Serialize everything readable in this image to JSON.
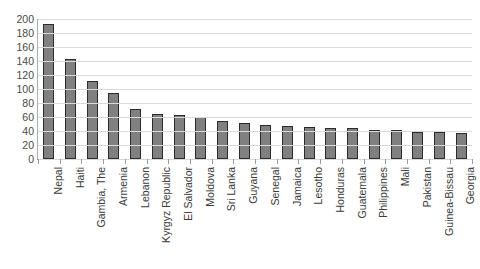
{
  "chart_data": {
    "type": "bar",
    "title": "",
    "xlabel": "",
    "ylabel": "",
    "ylim": [
      0,
      200
    ],
    "ytick_step": 20,
    "grid": true,
    "legend": false,
    "orientation": "vertical",
    "bar_color": "#808080",
    "bar_border_color": "#2b2b2b",
    "gridline_color": "#d9d9d9",
    "categories": [
      "Nepal",
      "Haiti",
      "Gambia, The",
      "Armenia",
      "Lebanon",
      "Kyrgyz Republic",
      "El Salvador",
      "Moldova",
      "Sri Lanka",
      "Guyana",
      "Senegal",
      "Jamaica",
      "Lesotho",
      "Honduras",
      "Guatemala",
      "Philippines",
      "Mali",
      "Pakistan",
      "Guinea-Bissau",
      "Georgia"
    ],
    "values": [
      193,
      143,
      111,
      94,
      71,
      65,
      63,
      60,
      54,
      51,
      48,
      47,
      46,
      45,
      44,
      42,
      41,
      39,
      38,
      37
    ],
    "yticks": [
      0,
      20,
      40,
      60,
      80,
      100,
      120,
      140,
      160,
      180,
      200
    ]
  },
  "clipped_title": ""
}
